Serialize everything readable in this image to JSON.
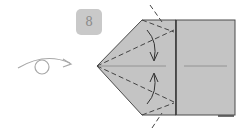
{
  "diagram": {
    "type": "origami-step",
    "step": {
      "number": "8"
    },
    "symbols": {
      "turn_over": "turn-over-arrow",
      "valley_folds": "dashed-lines",
      "fold_arrows": "curved-arrows"
    },
    "colors": {
      "paper": "#c4c4c4",
      "badge": "#c9c9c9",
      "line": "#4a4a4a",
      "arrow": "#a0a0a0"
    }
  }
}
